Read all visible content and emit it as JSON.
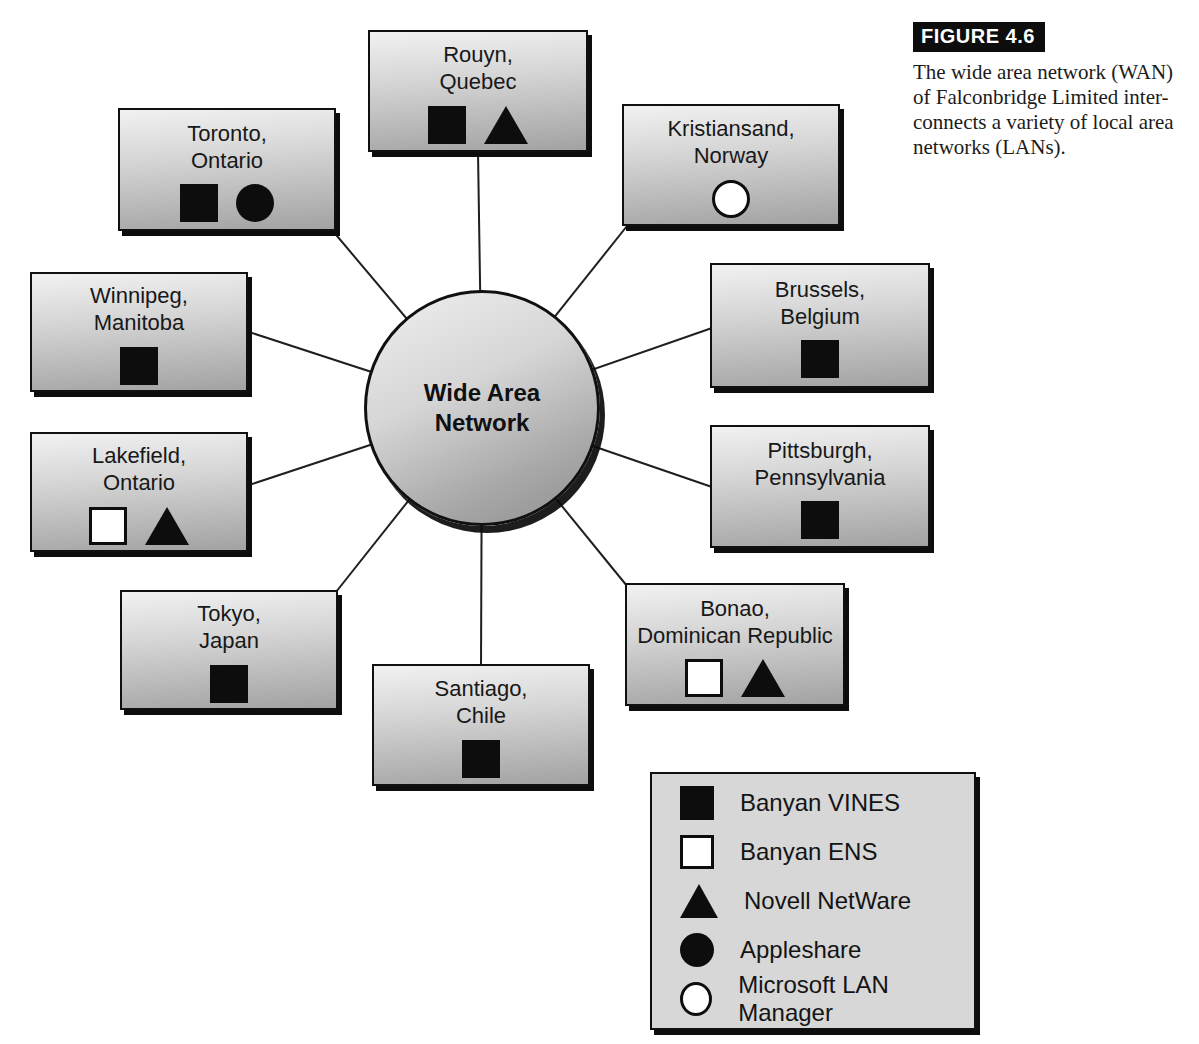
{
  "figure": {
    "label": "FIGURE 4.6",
    "caption": "The wide area network (WAN)\nof Falconbridge Limited inter-\nconnects a variety of local area\nnetworks (LANs)."
  },
  "hub": {
    "label": "Wide Area\nNetwork"
  },
  "nodes": [
    {
      "id": "rouyn",
      "label": "Rouyn,\nQuebec",
      "symbols": [
        "banyan-vines",
        "novell-netware"
      ]
    },
    {
      "id": "toronto",
      "label": "Toronto,\nOntario",
      "symbols": [
        "banyan-vines",
        "appleshare"
      ]
    },
    {
      "id": "kristiansand",
      "label": "Kristiansand,\nNorway",
      "symbols": [
        "microsoft-lan-manager"
      ]
    },
    {
      "id": "winnipeg",
      "label": "Winnipeg,\nManitoba",
      "symbols": [
        "banyan-vines"
      ]
    },
    {
      "id": "brussels",
      "label": "Brussels,\nBelgium",
      "symbols": [
        "banyan-vines"
      ]
    },
    {
      "id": "lakefield",
      "label": "Lakefield,\nOntario",
      "symbols": [
        "banyan-ens",
        "novell-netware"
      ]
    },
    {
      "id": "pittsburgh",
      "label": "Pittsburgh,\nPennsylvania",
      "symbols": [
        "banyan-vines"
      ]
    },
    {
      "id": "tokyo",
      "label": "Tokyo,\nJapan",
      "symbols": [
        "banyan-vines"
      ]
    },
    {
      "id": "bonao",
      "label": "Bonao,\nDominican Republic",
      "symbols": [
        "banyan-ens",
        "novell-netware"
      ]
    },
    {
      "id": "santiago",
      "label": "Santiago,\nChile",
      "symbols": [
        "banyan-vines"
      ]
    }
  ],
  "connections": [
    [
      "wide-area-network",
      "rouyn"
    ],
    [
      "wide-area-network",
      "toronto"
    ],
    [
      "wide-area-network",
      "kristiansand"
    ],
    [
      "wide-area-network",
      "winnipeg"
    ],
    [
      "wide-area-network",
      "brussels"
    ],
    [
      "wide-area-network",
      "lakefield"
    ],
    [
      "wide-area-network",
      "pittsburgh"
    ],
    [
      "wide-area-network",
      "tokyo"
    ],
    [
      "wide-area-network",
      "bonao"
    ],
    [
      "wide-area-network",
      "santiago"
    ]
  ],
  "legend": {
    "items": [
      {
        "symbol": "banyan-vines",
        "shape": "filled-square",
        "label": "Banyan VINES"
      },
      {
        "symbol": "banyan-ens",
        "shape": "open-square",
        "label": "Banyan ENS"
      },
      {
        "symbol": "novell-netware",
        "shape": "filled-triangle",
        "label": "Novell NetWare"
      },
      {
        "symbol": "appleshare",
        "shape": "filled-circle",
        "label": "Appleshare"
      },
      {
        "symbol": "microsoft-lan-manager",
        "shape": "open-circle",
        "label": "Microsoft LAN Manager"
      }
    ]
  },
  "colors": {
    "background": "#ffffff",
    "box_gradient_top": "#f1f1f1",
    "box_gradient_bottom": "#a2a2a2",
    "legend_background": "#d7d7d7",
    "border": "#101010",
    "symbol_fill": "#0d0d0d",
    "figure_label_background": "#0d0d0d",
    "figure_label_text": "#ffffff"
  }
}
